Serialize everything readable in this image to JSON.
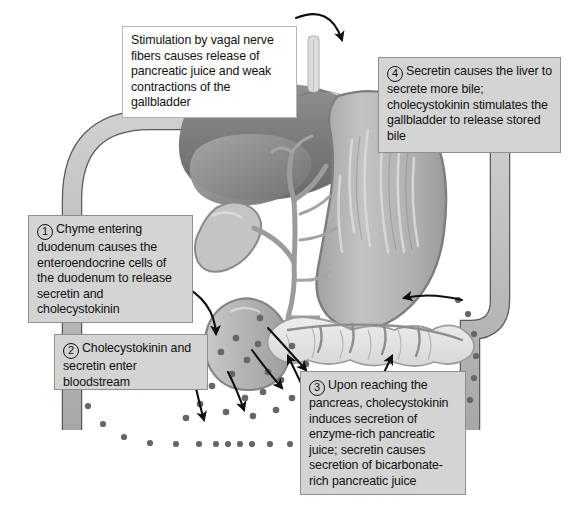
{
  "figure": {
    "background_color": "#ffffff"
  },
  "callouts": [
    {
      "id": "vagal-stimulation",
      "number": "",
      "style": "white",
      "text": "Stimulation by vagal nerve fibers causes release of pancreatic juice and weak contractions of the gallbladder"
    },
    {
      "id": "secretin-bile",
      "number": "4",
      "style": "gray",
      "text": "Secretin causes the liver to secrete more bile; cholecystokinin stimulates the gallbladder to release stored bile"
    },
    {
      "id": "chyme-duodenum",
      "number": "1",
      "style": "gray",
      "text": "Chyme entering duodenum causes the enteroendocrine cells of the duodenum to release secretin and cholecystokinin"
    },
    {
      "id": "hormones-bloodstream",
      "number": "2",
      "style": "gray",
      "text": "Cholecystokinin and secretin enter bloodstream"
    },
    {
      "id": "pancreas-secretion",
      "number": "3",
      "style": "gray",
      "text": "Upon reaching the pancreas, cholecystokinin induces secretion of enzyme-rich pancreatic juice; secretin causes secretion of bicarbonate-rich pancreatic juice"
    }
  ],
  "anatomy": {
    "labels": [
      "liver",
      "gallbladder",
      "stomach",
      "duodenum",
      "pancreas",
      "bile-duct",
      "pancreatic-duct",
      "vagus-nerve",
      "bloodstream-vessel",
      "hormone-molecules"
    ],
    "colors": {
      "vessel_fill": "#bdbdbd",
      "vessel_outline": "#4d4d4d",
      "liver_dark": "#7d7d7d",
      "liver_mid": "#9a9a9a",
      "stomach_fill": "#b6b6b6",
      "stomach_outline": "#8a8a8a",
      "pancreas_fill": "#e3e3e3",
      "duct_fill": "#a5a5a5",
      "molecule_dot": "#636363",
      "arrow": "#101010"
    }
  }
}
